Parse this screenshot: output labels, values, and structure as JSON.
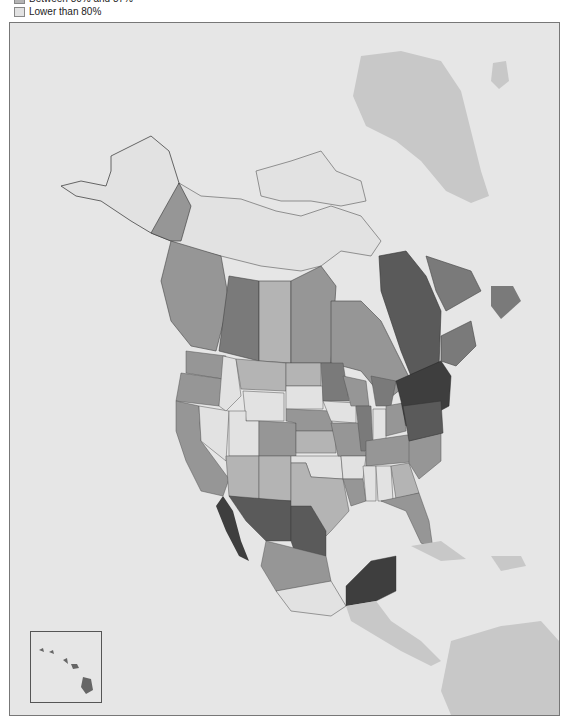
{
  "legend": {
    "items": [
      {
        "label": "Between 80% and 87%",
        "color": "#b4b4b4"
      },
      {
        "label": "Lower than 80%",
        "color": "#e2e2e2"
      }
    ]
  },
  "map": {
    "ocean_color": "#e6e6e6",
    "other_land_color": "#c8c8c8",
    "no_data_color": "#e4e4e4",
    "shades": {
      "darkest": "#3e3e3e",
      "dark": "#5a5a5a",
      "mid_dark": "#7a7a7a",
      "mid": "#969696",
      "light": "#b4b4b4",
      "lightest": "#e0e0e0"
    }
  },
  "inset": {
    "name": "Hawaii"
  }
}
